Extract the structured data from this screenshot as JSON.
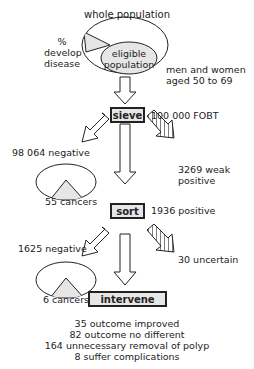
{
  "colors": {
    "line": "#222222",
    "fill": "#e6e6e6",
    "background": "#ffffff"
  },
  "top": {
    "title": "whole population",
    "disease_label": [
      "%",
      "develop",
      "disease"
    ],
    "eligible_label": [
      "eligible",
      "population"
    ],
    "eligible_desc": [
      "men and women",
      "aged 50 to 69"
    ]
  },
  "stages": {
    "sieve": {
      "label": "sieve",
      "count": "100 000 FOBT"
    },
    "sort": {
      "label": "sort",
      "count": "1936 positive"
    },
    "intervene": {
      "label": "intervene"
    }
  },
  "sieve_branches": {
    "negative": "98 064 negative",
    "negative_cancers": "55 cancers",
    "weak_positive": [
      "3269 weak",
      "positive"
    ]
  },
  "sort_branches": {
    "negative": "1625 negative",
    "negative_cancers": "6 cancers",
    "uncertain": "30 uncertain"
  },
  "outcomes": [
    "35 outcome improved",
    "82 outcome no different",
    "164 unnecessary removal of polyp",
    "8 suffer complications"
  ]
}
